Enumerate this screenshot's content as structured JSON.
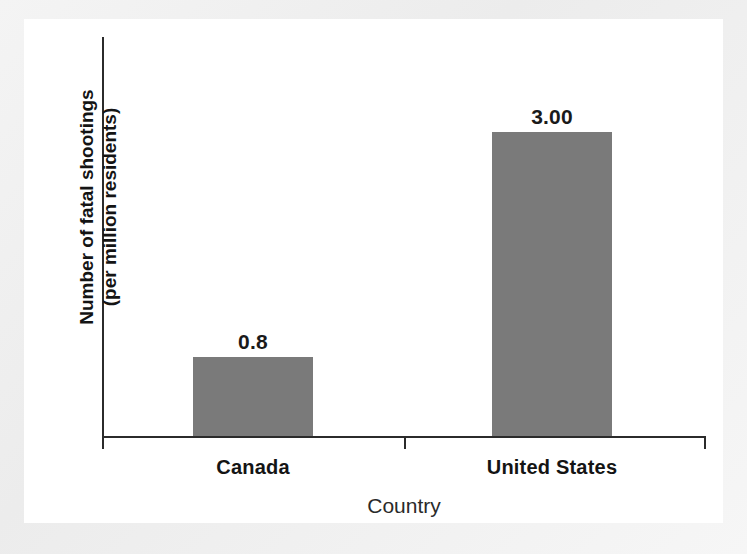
{
  "chart_data": {
    "type": "bar",
    "title": "",
    "categories": [
      "Canada",
      "United States"
    ],
    "values": [
      0.8,
      3.0
    ],
    "value_labels": [
      "0.8",
      "3.00"
    ],
    "xlabel": "Country",
    "ylabel": "Number of fatal shootings (per million residents)",
    "ylabel_lines": [
      "Number of fatal shootings",
      "(per million residents)"
    ],
    "ylim": [
      0,
      4.05
    ],
    "grid": false,
    "legend": null,
    "series": [
      {
        "name": "Number of fatal shootings (per million residents)",
        "values": [
          0.8,
          3.0
        ]
      }
    ],
    "bar_color": "#7a7a7a",
    "axis_color": "#2b2b2b",
    "background_color": "#ffffff",
    "tick_labels_y": []
  },
  "axes": {
    "y_title_line1": "Number of fatal shootings",
    "y_title_line2": "(per million residents)",
    "x_title": "Country"
  },
  "bars": [
    {
      "category": "Canada",
      "value_label": "0.8"
    },
    {
      "category": "United States",
      "value_label": "3.00"
    }
  ]
}
